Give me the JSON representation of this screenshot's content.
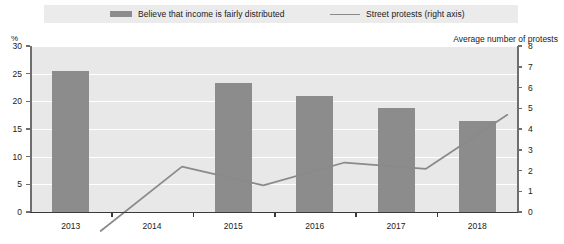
{
  "legend": {
    "items": [
      {
        "label": "Believe that income is fairly distributed",
        "marker": "bar-swatch",
        "color": "#8c8c8c"
      },
      {
        "label": "Street protests (right axis)",
        "marker": "line-swatch",
        "color": "#8a8a8a"
      }
    ]
  },
  "axes": {
    "left_title": "%",
    "right_title": "Average number of protests"
  },
  "chart_data": {
    "type": "bar",
    "title": "",
    "xlabel": "",
    "ylabel": "%",
    "y2label": "Average number of protests",
    "categories": [
      "2013",
      "2014",
      "2015",
      "2016",
      "2017",
      "2018"
    ],
    "ylim": [
      0,
      30
    ],
    "y2lim": [
      0,
      8
    ],
    "yticks": [
      0,
      5,
      10,
      15,
      20,
      25,
      30
    ],
    "y2ticks": [
      0,
      1,
      2,
      3,
      4,
      5,
      6,
      7,
      8
    ],
    "grid": true,
    "legend_position": "top",
    "series": [
      {
        "name": "Believe that income is fairly distributed",
        "type": "bar",
        "axis": "left",
        "color": "#8c8c8c",
        "values": [
          25.5,
          null,
          23.3,
          21.0,
          18.8,
          16.4
        ]
      },
      {
        "name": "Street protests (right axis)",
        "type": "line",
        "axis": "right",
        "color": "#8a8a8a",
        "values": [
          1.3,
          4.4,
          3.5,
          4.6,
          4.3,
          6.9
        ]
      }
    ]
  }
}
